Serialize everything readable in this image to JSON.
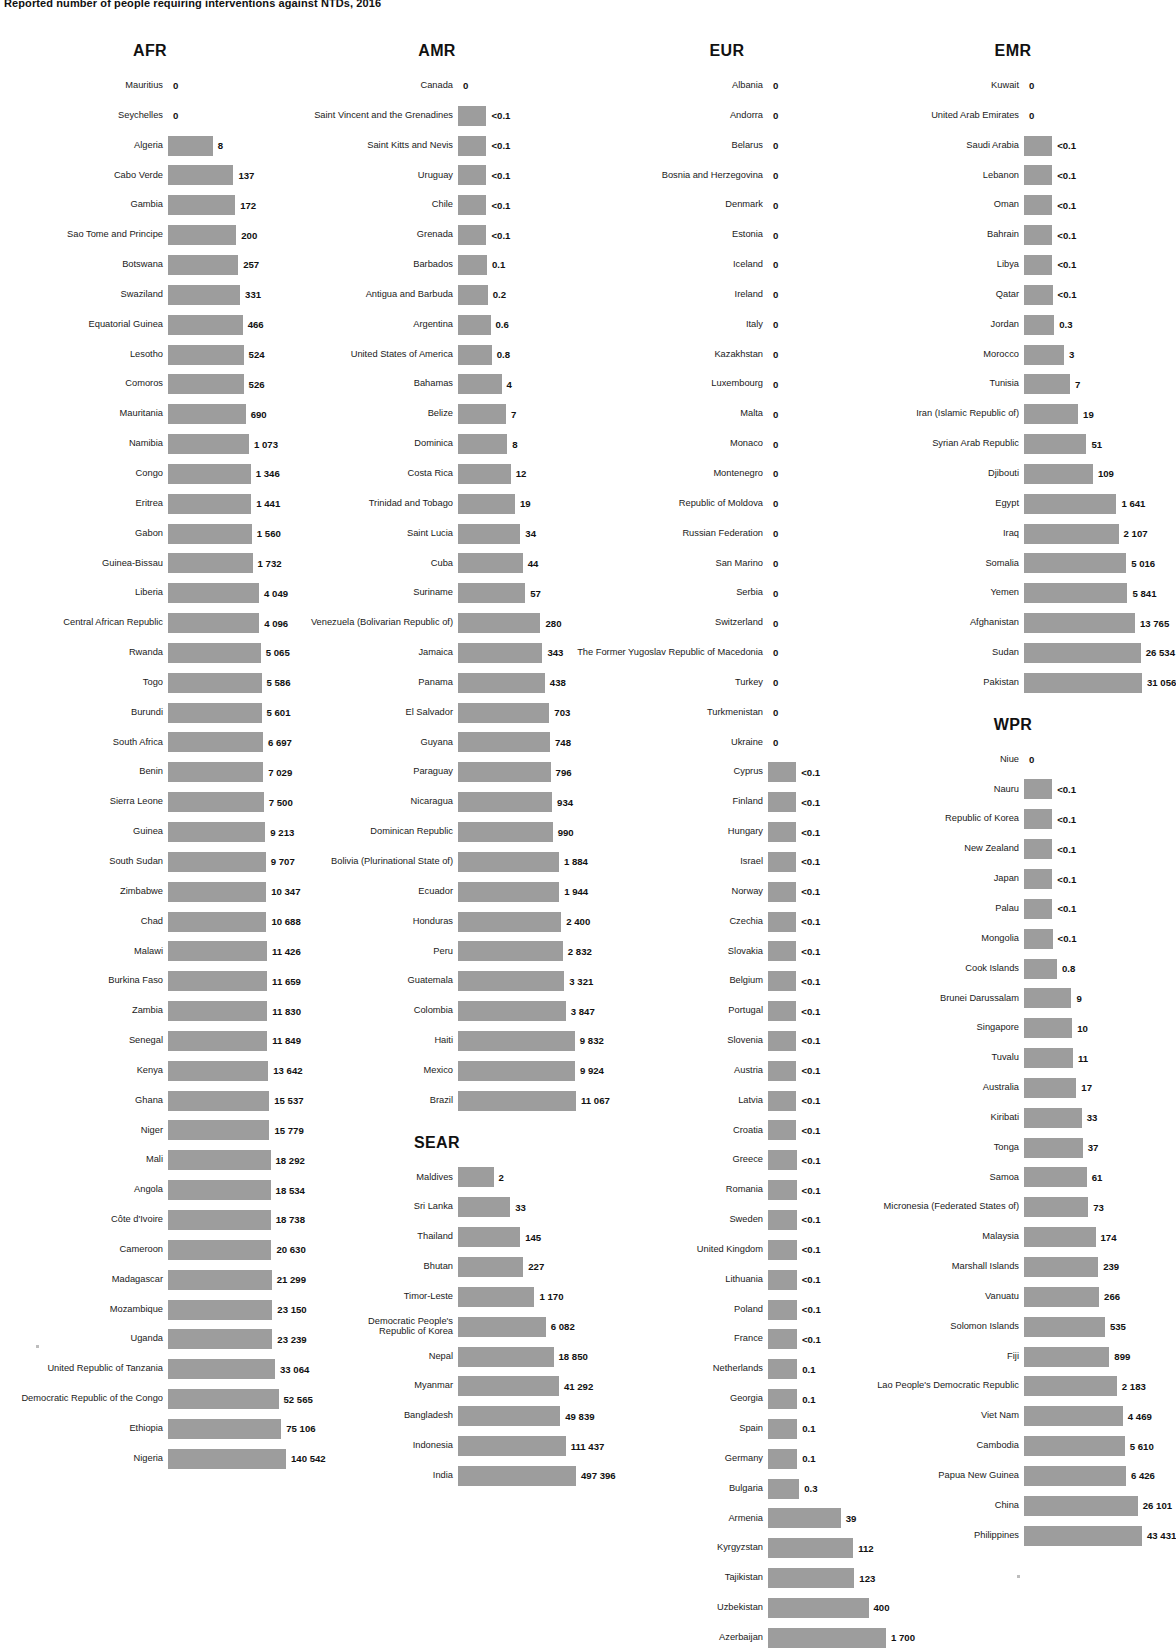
{
  "title": "Reported number of people requiring interventions against NTDs, 2016",
  "colors": {
    "bar": "#9d9d9d",
    "text": "#1a1a1a"
  },
  "chart_data": {
    "type": "bar",
    "title": "Reported number of people requiring interventions against NTDs, 2016",
    "xlabel": "",
    "ylabel": "",
    "orientation": "horizontal",
    "grid": false,
    "legend": false,
    "groups": [
      {
        "name": "AFR",
        "categories": [
          "Mauritius",
          "Seychelles",
          "Algeria",
          "Cabo Verde",
          "Gambia",
          "Sao Tome and Principe",
          "Botswana",
          "Swaziland",
          "Equatorial Guinea",
          "Lesotho",
          "Comoros",
          "Mauritania",
          "Namibia",
          "Congo",
          "Eritrea",
          "Gabon",
          "Guinea-Bissau",
          "Liberia",
          "Central African Republic",
          "Rwanda",
          "Togo",
          "Burundi",
          "South Africa",
          "Benin",
          "Sierra Leone",
          "Guinea",
          "South Sudan",
          "Zimbabwe",
          "Chad",
          "Malawi",
          "Burkina Faso",
          "Zambia",
          "Senegal",
          "Kenya",
          "Ghana",
          "Niger",
          "Mali",
          "Angola",
          "Côte d'Ivoire",
          "Cameroon",
          "Madagascar",
          "Mozambique",
          "Uganda",
          "United Republic of Tanzania",
          "Democratic Republic of the Congo",
          "Ethiopia",
          "Nigeria"
        ],
        "values": [
          0,
          0,
          8,
          137,
          172,
          200,
          257,
          331,
          466,
          524,
          526,
          690,
          1073,
          1346,
          1441,
          1560,
          1732,
          4049,
          4096,
          5065,
          5586,
          5601,
          6697,
          7029,
          7500,
          9213,
          9707,
          10347,
          10688,
          11426,
          11659,
          11830,
          11849,
          13642,
          15537,
          15779,
          18292,
          18534,
          18738,
          20630,
          21299,
          23150,
          23239,
          33064,
          52565,
          75106,
          140542
        ],
        "labels": [
          "0",
          "0",
          "8",
          "137",
          "172",
          "200",
          "257",
          "331",
          "466",
          "524",
          "526",
          "690",
          "1 073",
          "1 346",
          "1 441",
          "1 560",
          "1 732",
          "4 049",
          "4 096",
          "5 065",
          "5 586",
          "5 601",
          "6 697",
          "7 029",
          "7 500",
          "9 213",
          "9 707",
          "10 347",
          "10 688",
          "11 426",
          "11 659",
          "11 830",
          "11 849",
          "13 642",
          "15 537",
          "15 779",
          "18 292",
          "18 534",
          "18 738",
          "20 630",
          "21 299",
          "23 150",
          "23 239",
          "33 064",
          "52 565",
          "75 106",
          "140 542"
        ]
      },
      {
        "name": "AMR",
        "categories": [
          "Canada",
          "Saint Vincent and the Grenadines",
          "Saint Kitts and Nevis",
          "Uruguay",
          "Chile",
          "Grenada",
          "Barbados",
          "Antigua and Barbuda",
          "Argentina",
          "United States of America",
          "Bahamas",
          "Belize",
          "Dominica",
          "Costa Rica",
          "Trinidad and Tobago",
          "Saint Lucia",
          "Cuba",
          "Suriname",
          "Venezuela (Bolivarian Republic of)",
          "Jamaica",
          "Panama",
          "El Salvador",
          "Guyana",
          "Paraguay",
          "Nicaragua",
          "Dominican Republic",
          "Bolivia (Plurinational State of)",
          "Ecuador",
          "Honduras",
          "Peru",
          "Guatemala",
          "Colombia",
          "Haiti",
          "Mexico",
          "Brazil"
        ],
        "values": [
          0,
          0.05,
          0.05,
          0.05,
          0.05,
          0.05,
          0.1,
          0.2,
          0.6,
          0.8,
          4,
          7,
          8,
          12,
          19,
          34,
          44,
          57,
          280,
          343,
          438,
          703,
          748,
          796,
          934,
          990,
          1884,
          1944,
          2400,
          2832,
          3321,
          3847,
          9832,
          9924,
          11067
        ],
        "labels": [
          "0",
          "<0.1",
          "<0.1",
          "<0.1",
          "<0.1",
          "<0.1",
          "0.1",
          "0.2",
          "0.6",
          "0.8",
          "4",
          "7",
          "8",
          "12",
          "19",
          "34",
          "44",
          "57",
          "280",
          "343",
          "438",
          "703",
          "748",
          "796",
          "934",
          "990",
          "1 884",
          "1 944",
          "2 400",
          "2 832",
          "3 321",
          "3 847",
          "9 832",
          "9 924",
          "11 067"
        ]
      },
      {
        "name": "SEAR",
        "categories": [
          "Maldives",
          "Sri Lanka",
          "Thailand",
          "Bhutan",
          "Timor-Leste",
          "Democratic People's\nRepublic of Korea",
          "Nepal",
          "Myanmar",
          "Bangladesh",
          "Indonesia",
          "India"
        ],
        "values": [
          2,
          33,
          145,
          227,
          1170,
          6082,
          18850,
          41292,
          49839,
          111437,
          497396
        ],
        "labels": [
          "2",
          "33",
          "145",
          "227",
          "1 170",
          "6 082",
          "18 850",
          "41 292",
          "49 839",
          "111 437",
          "497 396"
        ]
      },
      {
        "name": "EUR",
        "categories": [
          "Albania",
          "Andorra",
          "Belarus",
          "Bosnia and Herzegovina",
          "Denmark",
          "Estonia",
          "Iceland",
          "Ireland",
          "Italy",
          "Kazakhstan",
          "Luxembourg",
          "Malta",
          "Monaco",
          "Montenegro",
          "Republic of Moldova",
          "Russian Federation",
          "San Marino",
          "Serbia",
          "Switzerland",
          "The Former Yugoslav Republic of Macedonia",
          "Turkey",
          "Turkmenistan",
          "Ukraine",
          "Cyprus",
          "Finland",
          "Hungary",
          "Israel",
          "Norway",
          "Czechia",
          "Slovakia",
          "Belgium",
          "Portugal",
          "Slovenia",
          "Austria",
          "Latvia",
          "Croatia",
          "Greece",
          "Romania",
          "Sweden",
          "United Kingdom",
          "Lithuania",
          "Poland",
          "France",
          "Netherlands",
          "Georgia",
          "Spain",
          "Germany",
          "Bulgaria",
          "Armenia",
          "Kyrgyzstan",
          "Tajikistan",
          "Uzbekistan",
          "Azerbaijan"
        ],
        "values": [
          0,
          0,
          0,
          0,
          0,
          0,
          0,
          0,
          0,
          0,
          0,
          0,
          0,
          0,
          0,
          0,
          0,
          0,
          0,
          0,
          0,
          0,
          0,
          0.02,
          0.02,
          0.02,
          0.02,
          0.02,
          0.03,
          0.03,
          0.03,
          0.03,
          0.04,
          0.04,
          0.04,
          0.04,
          0.05,
          0.05,
          0.05,
          0.06,
          0.06,
          0.07,
          0.08,
          0.1,
          0.1,
          0.1,
          0.1,
          0.3,
          39,
          112,
          123,
          400,
          1700
        ],
        "labels": [
          "0",
          "0",
          "0",
          "0",
          "0",
          "0",
          "0",
          "0",
          "0",
          "0",
          "0",
          "0",
          "0",
          "0",
          "0",
          "0",
          "0",
          "0",
          "0",
          "0",
          "0",
          "0",
          "0",
          "<0.1",
          "<0.1",
          "<0.1",
          "<0.1",
          "<0.1",
          "<0.1",
          "<0.1",
          "<0.1",
          "<0.1",
          "<0.1",
          "<0.1",
          "<0.1",
          "<0.1",
          "<0.1",
          "<0.1",
          "<0.1",
          "<0.1",
          "<0.1",
          "<0.1",
          "<0.1",
          "0.1",
          "0.1",
          "0.1",
          "0.1",
          "0.3",
          "39",
          "112",
          "123",
          "400",
          "1 700"
        ]
      },
      {
        "name": "EMR",
        "categories": [
          "Kuwait",
          "United Arab Emirates",
          "Saudi Arabia",
          "Lebanon",
          "Oman",
          "Bahrain",
          "Libya",
          "Qatar",
          "Jordan",
          "Morocco",
          "Tunisia",
          "Iran (Islamic Republic of)",
          "Syrian Arab Republic",
          "Djibouti",
          "Egypt",
          "Iraq",
          "Somalia",
          "Yemen",
          "Afghanistan",
          "Sudan",
          "Pakistan"
        ],
        "values": [
          0,
          0,
          0.02,
          0.03,
          0.03,
          0.04,
          0.05,
          0.07,
          0.3,
          3,
          7,
          19,
          51,
          109,
          1641,
          2107,
          5016,
          5841,
          13765,
          26534,
          31056
        ],
        "labels": [
          "0",
          "0",
          "<0.1",
          "<0.1",
          "<0.1",
          "<0.1",
          "<0.1",
          "<0.1",
          "0.3",
          "3",
          "7",
          "19",
          "51",
          "109",
          "1 641",
          "2 107",
          "5 016",
          "5 841",
          "13 765",
          "26 534",
          "31 056"
        ]
      },
      {
        "name": "WPR",
        "categories": [
          "Niue",
          "Nauru",
          "Republic of Korea",
          "New Zealand",
          "Japan",
          "Palau",
          "Mongolia",
          "Cook Islands",
          "Brunei Darussalam",
          "Singapore",
          "Tuvalu",
          "Australia",
          "Kiribati",
          "Tonga",
          "Samoa",
          "Micronesia (Federated States of)",
          "Malaysia",
          "Marshall Islands",
          "Vanuatu",
          "Solomon Islands",
          "Fiji",
          "Lao People's Democratic Republic",
          "Viet Nam",
          "Cambodia",
          "Papua New Guinea",
          "China",
          "Philippines"
        ],
        "values": [
          0,
          0.02,
          0.03,
          0.03,
          0.04,
          0.05,
          0.07,
          0.8,
          9,
          10,
          11,
          17,
          33,
          37,
          61,
          73,
          174,
          239,
          266,
          535,
          899,
          2183,
          4469,
          5610,
          6426,
          26101,
          43431
        ],
        "labels": [
          "0",
          "<0.1",
          "<0.1",
          "<0.1",
          "<0.1",
          "<0.1",
          "<0.1",
          "0.8",
          "9",
          "10",
          "11",
          "17",
          "33",
          "37",
          "61",
          "73",
          "174",
          "239",
          "266",
          "535",
          "899",
          "2 183",
          "4 469",
          "5 610",
          "6 426",
          "26 101",
          "43 431"
        ]
      }
    ]
  }
}
